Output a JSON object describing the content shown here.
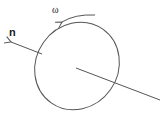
{
  "diagram": {
    "labels": {
      "normal": "n",
      "angular_velocity": "ω"
    },
    "colors": {
      "stroke": "#555555",
      "text": "#222222",
      "background": "#ffffff"
    }
  }
}
